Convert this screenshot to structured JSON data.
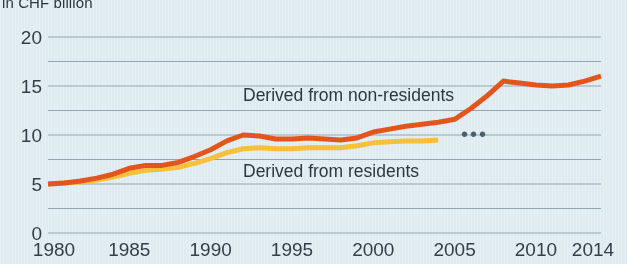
{
  "chart_data": {
    "type": "line",
    "title": "",
    "subtitle": "",
    "axis_note": "in CHF  billion",
    "xlabel": "",
    "ylabel": "in CHF  billion",
    "xlim": [
      1980,
      2014
    ],
    "ylim": [
      0,
      20
    ],
    "grid": true,
    "grid_major_step": 5,
    "grid_minor_step": 2.5,
    "legend_position": "inline-annotations",
    "x_tick_labels": [
      "1980",
      "1985",
      "1990",
      "1995",
      "2000",
      "2005",
      "2010",
      "2014"
    ],
    "x_tick_values": [
      1980,
      1985,
      1990,
      1995,
      2000,
      2005,
      2010,
      2014
    ],
    "y_tick_labels": [
      "0",
      "5",
      "10",
      "15",
      "20"
    ],
    "y_tick_values": [
      0,
      5,
      10,
      15,
      20
    ],
    "y_gridline_values": [
      0,
      2.5,
      5,
      7.5,
      10,
      12.5,
      15,
      17.5,
      20
    ],
    "annotations": [
      {
        "name": "series-label-non-residents",
        "text": "Derived from non-residents"
      },
      {
        "name": "series-label-residents",
        "text": "Derived from residents"
      },
      {
        "name": "data-break-ellipsis",
        "text": "•••"
      }
    ],
    "series": [
      {
        "name": "Derived from non-residents",
        "color": "#e8561d",
        "x": [
          1980,
          1981,
          1982,
          1983,
          1984,
          1985,
          1986,
          1987,
          1988,
          1989,
          1990,
          1991,
          1992,
          1993,
          1994,
          1995,
          1996,
          1997,
          1998,
          1999,
          2000,
          2001,
          2002,
          2003,
          2004,
          2005,
          2006,
          2007,
          2008,
          2009,
          2010,
          2011,
          2012,
          2013,
          2014
        ],
        "values": [
          5.0,
          5.1,
          5.3,
          5.6,
          6.0,
          6.6,
          6.9,
          6.9,
          7.2,
          7.8,
          8.5,
          9.4,
          10.0,
          9.9,
          9.6,
          9.6,
          9.7,
          9.6,
          9.5,
          9.7,
          10.3,
          10.6,
          10.9,
          11.1,
          11.3,
          11.6,
          12.7,
          14.0,
          15.5,
          15.3,
          15.1,
          15.0,
          15.1,
          15.5,
          16.0
        ]
      },
      {
        "name": "Derived from residents",
        "color": "#fcc23c",
        "x": [
          1980,
          1981,
          1982,
          1983,
          1984,
          1985,
          1986,
          1987,
          1988,
          1989,
          1990,
          1991,
          1992,
          1993,
          1994,
          1995,
          1996,
          1997,
          1998,
          1999,
          2000,
          2001,
          2002,
          2003,
          2004
        ],
        "values": [
          5.0,
          5.1,
          5.2,
          5.4,
          5.7,
          6.1,
          6.4,
          6.5,
          6.7,
          7.1,
          7.6,
          8.2,
          8.6,
          8.7,
          8.6,
          8.6,
          8.7,
          8.7,
          8.7,
          8.9,
          9.2,
          9.3,
          9.4,
          9.4,
          9.5
        ]
      }
    ],
    "colors": {
      "background": "#e6eff4",
      "gridline": "#93a8b4",
      "text": "#343f47",
      "series_non_residents": "#e8561d",
      "series_residents": "#fcc23c"
    }
  }
}
